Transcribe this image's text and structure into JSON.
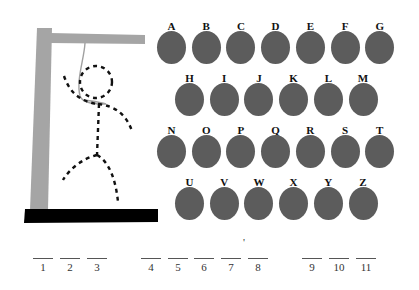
{
  "colors": {
    "key": "#5c5c5c",
    "post": "#a5a5a5",
    "base": "#000000",
    "rope": "#a0a0a0",
    "figure": "#111111"
  },
  "keyboard": {
    "rows": [
      [
        "A",
        "B",
        "C",
        "D",
        "E",
        "F",
        "G"
      ],
      [
        "H",
        "I",
        "J",
        "K",
        "L",
        "M"
      ],
      [
        "N",
        "O",
        "P",
        "Q",
        "R",
        "S",
        "T"
      ],
      [
        "U",
        "V",
        "W",
        "X",
        "Y",
        "Z"
      ]
    ]
  },
  "puzzle": {
    "blanks": [
      {
        "num": "1",
        "letter": ""
      },
      {
        "num": "2",
        "letter": ""
      },
      {
        "num": "3",
        "letter": ""
      },
      {
        "num": "4",
        "letter": ""
      },
      {
        "num": "5",
        "letter": ""
      },
      {
        "num": "6",
        "letter": ""
      },
      {
        "num": "7",
        "letter": ""
      },
      {
        "num": "8",
        "letter": ""
      },
      {
        "num": "9",
        "letter": ""
      },
      {
        "num": "10",
        "letter": ""
      },
      {
        "num": "11",
        "letter": ""
      }
    ],
    "apostrophe": "'"
  }
}
